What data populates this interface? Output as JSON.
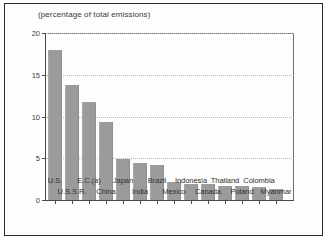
{
  "title": "(percentage of total emissions)",
  "chart_data": {
    "type": "bar",
    "title": "(percentage of total emissions)",
    "xlabel": "",
    "ylabel": "",
    "ylim": [
      0,
      20
    ],
    "yticks": [
      0,
      5,
      10,
      15,
      20
    ],
    "grid": true,
    "legend": null,
    "bar_color": "#9b9b9b",
    "categories": [
      "U.S.",
      "U.S.S.R.",
      "E.C.(a)",
      "China",
      "Japan",
      "India",
      "Brazil",
      "Mexico",
      "Indonesia",
      "Canada",
      "Thailand",
      "Poland",
      "Colombia",
      "Myanmar"
    ],
    "values": [
      18.0,
      13.8,
      11.7,
      9.4,
      4.9,
      4.4,
      4.2,
      2.2,
      1.9,
      1.9,
      1.7,
      1.7,
      1.6,
      1.3
    ],
    "label_rows": [
      1,
      0,
      1,
      0,
      1,
      0,
      1,
      0,
      1,
      0,
      1,
      0,
      1,
      0
    ]
  }
}
